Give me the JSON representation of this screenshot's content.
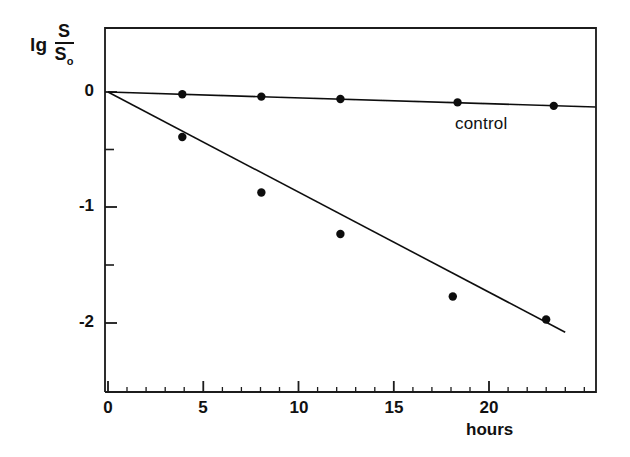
{
  "chart_data": {
    "type": "scatter",
    "title": "",
    "subtitle": "",
    "xlabel": "hours",
    "ylabel": "lg S/S₀",
    "ylabel_parts": {
      "prefix": "lg",
      "numerator": "S",
      "denominator": "S",
      "denominator_sub": "o"
    },
    "xlim": [
      0,
      25.7
    ],
    "ylim": [
      -2.6,
      0.55
    ],
    "grid": false,
    "legend_position": "inline-annotation",
    "x_ticks_major": [
      0,
      5,
      10,
      15,
      20
    ],
    "x_tick_labels": [
      "0",
      "5",
      "10",
      "15",
      "20"
    ],
    "x_ticks_minor": [
      1,
      2,
      3,
      4,
      6,
      7,
      8,
      9,
      11,
      12,
      13,
      14,
      16,
      17,
      18,
      19,
      21,
      22,
      23,
      24,
      25
    ],
    "y_ticks_major": [
      0,
      -1,
      -2
    ],
    "y_tick_labels": [
      "0",
      "-1",
      "-2"
    ],
    "y_ticks_minor": [
      -0.5,
      -1.5
    ],
    "annotations": [
      {
        "text": "control",
        "x": 18.3,
        "y": -0.21
      }
    ],
    "series": [
      {
        "name": "control",
        "marker": "filled-circle",
        "line": "solid",
        "color": "#111111",
        "points": [
          {
            "x": 3.9,
            "y": -0.02
          },
          {
            "x": 8.05,
            "y": -0.04
          },
          {
            "x": 12.2,
            "y": -0.06
          },
          {
            "x": 18.35,
            "y": -0.09
          },
          {
            "x": 23.4,
            "y": -0.12
          }
        ],
        "fit_line": {
          "x0": 0,
          "y0": 0.0,
          "x1": 25.6,
          "y1": -0.13
        }
      },
      {
        "name": "treated",
        "marker": "filled-circle",
        "line": "solid",
        "color": "#111111",
        "points": [
          {
            "x": 3.9,
            "y": -0.39
          },
          {
            "x": 8.05,
            "y": -0.87
          },
          {
            "x": 12.2,
            "y": -1.23
          },
          {
            "x": 18.1,
            "y": -1.77
          },
          {
            "x": 23.0,
            "y": -1.97
          }
        ],
        "fit_line": {
          "x0": 0,
          "y0": 0.0,
          "x1": 24.0,
          "y1": -2.08
        }
      }
    ]
  },
  "axes": {
    "frame": {
      "left": 105,
      "top": 28,
      "right": 596,
      "bottom": 392
    },
    "origin": {
      "x": 108,
      "y": 92
    },
    "px_per_hour": 19.05,
    "px_per_unit_y": 115.5
  },
  "style": {
    "ink_color": "#111111",
    "background_color": "#ffffff",
    "marker_radius": 4.2,
    "line_width": 1.6
  }
}
